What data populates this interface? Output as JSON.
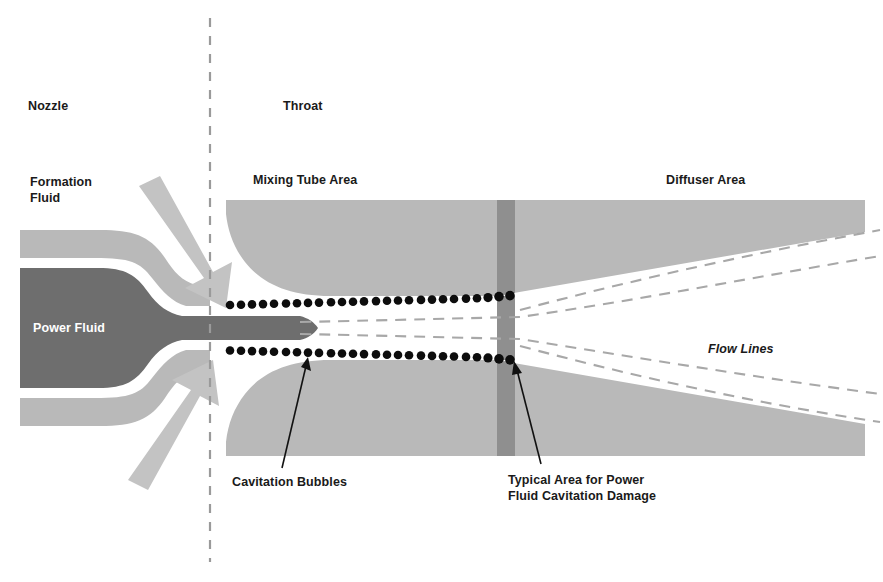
{
  "figure": {
    "width": 883,
    "height": 582,
    "background": "#ffffff"
  },
  "colors": {
    "body_gray": "#b9b9b9",
    "power_fluid_gray": "#6e6e6e",
    "damage_band_gray": "#8f8f8f",
    "arrow_gray": "#c3c3c3",
    "bubble_black": "#0d0d0d",
    "flow_line_gray": "#a8a8a8",
    "divider_gray": "#9a9a9a",
    "text_black": "#1a1a1a",
    "text_white": "#ffffff"
  },
  "sections": {
    "nozzle_label": "Nozzle",
    "throat_label": "Throat"
  },
  "labels": {
    "formation_fluid": "Formation\nFluid",
    "power_fluid": "Power Fluid",
    "mixing_tube_area": "Mixing Tube Area",
    "diffuser_area": "Diffuser Area",
    "flow_lines": "Flow Lines",
    "cavitation_bubbles": "Cavitation Bubbles",
    "cavitation_damage": "Typical Area for Power\nFluid Cavitation Damage"
  },
  "divider": {
    "name": "nozzle-throat-divider",
    "x": 210,
    "y_top": 18,
    "y_bottom": 562,
    "dash": "9 9"
  },
  "bubbles": {
    "diameter": 8.5,
    "spacing": 11.2,
    "top_row": {
      "x_start": 226,
      "x_end": 512,
      "y_start": 305,
      "y_end": 296
    },
    "bottom_row": {
      "x_start": 226,
      "x_end": 512,
      "y_start": 350,
      "y_end": 358
    }
  },
  "flow_lines": [
    {
      "name": "throat-flow-line-upper",
      "points": "300,322 520,318 700,290 880,258"
    },
    {
      "name": "throat-flow-line-lower",
      "points": "300,333 520,337 700,360 880,392"
    },
    {
      "name": "diffuser-flow-line-outer-upper",
      "points": "520,312 700,268 880,232"
    },
    {
      "name": "diffuser-flow-line-outer-lower",
      "points": "520,344 700,385 880,420"
    }
  ],
  "leaders": [
    {
      "name": "cavitation-bubbles-leader",
      "from_x": 282,
      "from_y": 470,
      "to_x": 310,
      "to_y": 360
    },
    {
      "name": "cavitation-damage-leader",
      "from_x": 540,
      "from_y": 466,
      "to_x": 515,
      "to_y": 363
    }
  ],
  "arrows": {
    "upper": {
      "name": "formation-fluid-inflow-arrow-upper",
      "direction": "down-right"
    },
    "lower": {
      "name": "formation-fluid-inflow-arrow-lower",
      "direction": "up-right"
    }
  }
}
